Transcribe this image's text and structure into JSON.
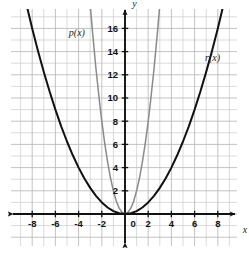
{
  "chart_data": {
    "type": "line",
    "title": "",
    "xlabel": "x",
    "ylabel": "y",
    "grid": true,
    "legend_position": "inline-curve-labels",
    "xlim": [
      -9.7,
      10.6
    ],
    "ylim": [
      -3.4,
      18.6
    ],
    "x_ticks": [
      -8,
      -6,
      -4,
      -2,
      0,
      2,
      4,
      6,
      8
    ],
    "x_tick_labels": [
      "-8",
      "-6",
      "-4",
      "-2",
      "0",
      "2",
      "4",
      "6",
      "8"
    ],
    "y_ticks": [
      2,
      4,
      6,
      8,
      10,
      12,
      14,
      16
    ],
    "y_tick_labels": [
      "2",
      "4",
      "6",
      "8",
      "10",
      "12",
      "14",
      "16"
    ],
    "minor_grid_step": 1,
    "series": [
      {
        "name": "p(x)",
        "label": "p(x)",
        "color": "#8a8a8a",
        "equation_form": "2x^2",
        "coefficient": 2,
        "vertex": [
          0,
          0
        ],
        "arrows": [
          "up-left",
          "up-right"
        ],
        "points": [
          [
            -3.05,
            18.6
          ],
          [
            -2.8,
            15.7
          ],
          [
            -2.5,
            12.5
          ],
          [
            -2.2,
            9.7
          ],
          [
            -2.0,
            8.0
          ],
          [
            -1.75,
            6.1
          ],
          [
            -1.5,
            4.5
          ],
          [
            -1.25,
            3.1
          ],
          [
            -1.0,
            2.0
          ],
          [
            -0.75,
            1.1
          ],
          [
            -0.5,
            0.5
          ],
          [
            -0.25,
            0.13
          ],
          [
            0,
            0
          ],
          [
            0.25,
            0.13
          ],
          [
            0.5,
            0.5
          ],
          [
            0.75,
            1.1
          ],
          [
            1.0,
            2.0
          ],
          [
            1.25,
            3.1
          ],
          [
            1.5,
            4.5
          ],
          [
            1.75,
            6.1
          ],
          [
            2.0,
            8.0
          ],
          [
            2.2,
            9.7
          ],
          [
            2.5,
            12.5
          ],
          [
            2.8,
            15.7
          ],
          [
            3.05,
            18.6
          ]
        ]
      },
      {
        "name": "r(x)",
        "label": "r(x)",
        "color": "#111111",
        "equation_form": "0.25x^2",
        "coefficient": 0.25,
        "vertex": [
          0,
          0
        ],
        "arrows": [
          "up-left",
          "up-right"
        ],
        "points": [
          [
            -8.6,
            18.5
          ],
          [
            -8.0,
            16.0
          ],
          [
            -7.5,
            14.06
          ],
          [
            -7.0,
            12.25
          ],
          [
            -6.5,
            10.56
          ],
          [
            -6.0,
            9.0
          ],
          [
            -5.5,
            7.56
          ],
          [
            -5.0,
            6.25
          ],
          [
            -4.5,
            5.06
          ],
          [
            -4.0,
            4.0
          ],
          [
            -3.5,
            3.06
          ],
          [
            -3.0,
            2.25
          ],
          [
            -2.5,
            1.56
          ],
          [
            -2.0,
            1.0
          ],
          [
            -1.5,
            0.56
          ],
          [
            -1.0,
            0.25
          ],
          [
            -0.5,
            0.06
          ],
          [
            0,
            0
          ],
          [
            0.5,
            0.06
          ],
          [
            1.0,
            0.25
          ],
          [
            1.5,
            0.56
          ],
          [
            2.0,
            1.0
          ],
          [
            2.5,
            1.56
          ],
          [
            3.0,
            2.25
          ],
          [
            3.5,
            3.06
          ],
          [
            4.0,
            4.0
          ],
          [
            4.5,
            5.06
          ],
          [
            5.0,
            6.25
          ],
          [
            5.5,
            7.56
          ],
          [
            6.0,
            9.0
          ],
          [
            6.5,
            10.56
          ],
          [
            7.0,
            12.25
          ],
          [
            7.5,
            14.06
          ],
          [
            8.0,
            16.0
          ],
          [
            8.6,
            18.5
          ]
        ]
      }
    ],
    "annotations": [
      {
        "text": "p(x)",
        "x": -4.15,
        "y": 15.6
      },
      {
        "text": "r(x)",
        "x": 7.55,
        "y": 13.5
      },
      {
        "text": "y",
        "x": 0.62,
        "y": 18.15
      },
      {
        "text": "x",
        "x": 10.15,
        "y": -1.35
      },
      {
        "text": "0",
        "x": 0.52,
        "y": -1.25
      }
    ]
  },
  "colors": {
    "background": "#ffffff",
    "grid_minor": "#c8c8c8",
    "grid_major": "#b0b0b0",
    "axis": "#111111",
    "curve_p": "#8a8a8a",
    "curve_r": "#111111",
    "text": "#111111"
  },
  "axes": {
    "x_axis_label": "x",
    "y_axis_label": "y",
    "origin_label": "0"
  }
}
